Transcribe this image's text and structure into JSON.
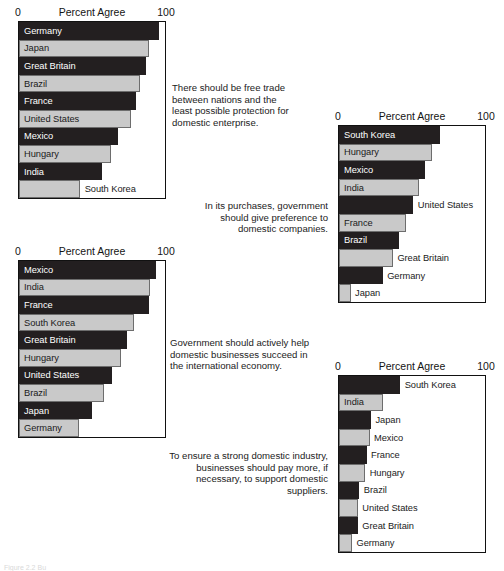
{
  "figure": {
    "axis_title": "Percent Agree",
    "tick_min": "0",
    "tick_max": "100",
    "caption": "Figure 2.2   Bu",
    "colors": {
      "dark_bar": "#231f20",
      "light_bar": "#c9c9c9",
      "axis": "#111111",
      "background": "#ffffff"
    }
  },
  "chart_data": [
    {
      "id": "free-trade",
      "type": "bar",
      "orientation": "horizontal",
      "title": "There should be free trade between nations and the least possible protection for domestic enterprise.",
      "xlabel": "Percent Agree",
      "ylabel": "",
      "xlim": [
        0,
        100
      ],
      "grid": false,
      "legend": "none",
      "categories": [
        "Germany",
        "Japan",
        "Great Britain",
        "Brazil",
        "France",
        "United States",
        "Mexico",
        "Hungary",
        "India",
        "South Korea"
      ],
      "values": [
        96,
        89,
        87,
        83,
        80,
        77,
        68,
        63,
        57,
        42
      ],
      "shades": [
        "dark",
        "light",
        "dark",
        "light",
        "dark",
        "light",
        "dark",
        "light",
        "dark",
        "light"
      ]
    },
    {
      "id": "government-preference",
      "type": "bar",
      "orientation": "horizontal",
      "title": "In its purchases, government should give preference to domestic companies.",
      "xlabel": "Percent Agree",
      "ylabel": "",
      "xlim": [
        0,
        100
      ],
      "grid": false,
      "legend": "none",
      "categories": [
        "South Korea",
        "Hungary",
        "Mexico",
        "India",
        "United States",
        "France",
        "Brazil",
        "Great Britain",
        "Germany",
        "Japan"
      ],
      "values": [
        69,
        64,
        59,
        55,
        51,
        46,
        41,
        37,
        30,
        8
      ],
      "shades": [
        "dark",
        "light",
        "dark",
        "light",
        "dark",
        "light",
        "dark",
        "light",
        "dark",
        "light"
      ]
    },
    {
      "id": "government-help",
      "type": "bar",
      "orientation": "horizontal",
      "title": "Government should actively help domestic businesses succeed in the international economy.",
      "xlabel": "Percent Agree",
      "ylabel": "",
      "xlim": [
        0,
        100
      ],
      "grid": false,
      "legend": "none",
      "categories": [
        "Mexico",
        "India",
        "France",
        "South Korea",
        "Great Britain",
        "Hungary",
        "United States",
        "Brazil",
        "Japan",
        "Germany"
      ],
      "values": [
        94,
        90,
        89,
        79,
        74,
        70,
        64,
        58,
        50,
        41
      ],
      "shades": [
        "dark",
        "light",
        "dark",
        "light",
        "dark",
        "light",
        "dark",
        "light",
        "dark",
        "light"
      ]
    },
    {
      "id": "pay-more-domestic",
      "type": "bar",
      "orientation": "horizontal",
      "title": "To ensure a strong domestic industry, businesses should pay more, if necessary, to support domestic suppliers.",
      "xlabel": "Percent Agree",
      "ylabel": "",
      "xlim": [
        0,
        100
      ],
      "grid": false,
      "legend": "none",
      "categories": [
        "South Korea",
        "India",
        "Japan",
        "Mexico",
        "France",
        "Hungary",
        "Brazil",
        "United States",
        "Great Britain",
        "Germany"
      ],
      "values": [
        42,
        30,
        22,
        21,
        19,
        18,
        14,
        13,
        13,
        9
      ],
      "shades": [
        "dark",
        "light",
        "dark",
        "light",
        "dark",
        "light",
        "dark",
        "light",
        "dark",
        "light"
      ]
    }
  ]
}
